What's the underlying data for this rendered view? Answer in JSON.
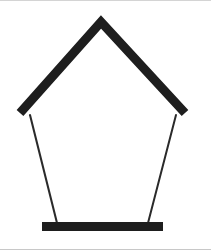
{
  "figure": {
    "colors": {
      "background": "#ffffff",
      "stroke": "#1e1e1e",
      "frame_line_top": "#d4d4d4",
      "frame_line_bottom": "#c8c8c8"
    },
    "roof": {
      "left": [
        20,
        113
      ],
      "apex": [
        101,
        22
      ],
      "right": [
        185,
        113
      ],
      "thickness": 9
    },
    "left_rope": {
      "from": [
        30,
        115
      ],
      "to": [
        57,
        223
      ],
      "thickness": 2
    },
    "right_rope": {
      "from": [
        176,
        115
      ],
      "to": [
        148,
        223
      ],
      "thickness": 2
    },
    "base": {
      "x": 42,
      "y": 222,
      "width": 121,
      "height": 9
    }
  }
}
